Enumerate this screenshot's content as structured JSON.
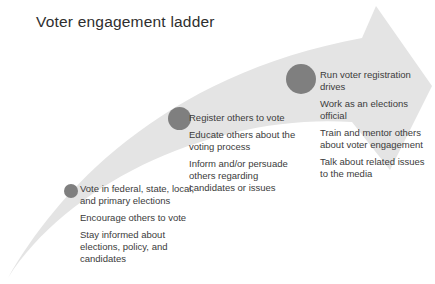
{
  "title": "Voter engagement ladder",
  "colors": {
    "background": "#ffffff",
    "arrow": "#e4e4e4",
    "dot": "#7f7f7f",
    "titleText": "#2e2e2e",
    "bodyText": "#3b3b3b"
  },
  "icons": {
    "arrow": "swoosh-arrow-up-right"
  },
  "levels": [
    {
      "id": "level-1",
      "items": [
        "Vote in federal, state, local, and primary elections",
        "Encourage others to vote",
        "Stay informed about elections, policy, and candidates"
      ]
    },
    {
      "id": "level-2",
      "items": [
        "Register others to vote",
        "Educate others about the voting process",
        "Inform and/or persuade others regarding candidates or issues"
      ]
    },
    {
      "id": "level-3",
      "items": [
        "Run voter registration drives",
        "Work as an elections official",
        "Train and mentor others about voter engagement",
        "Talk about related issues to the media"
      ]
    }
  ]
}
